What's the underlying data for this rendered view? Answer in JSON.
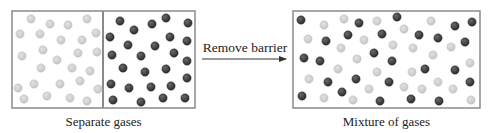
{
  "colors": {
    "box_border": "#8a8a8a",
    "divider": "#8a8a8a",
    "light_particle": "#cfcfcf",
    "light_particle_edge": "#bdbdbd",
    "dark_particle": "#3c3c3c",
    "dark_particle_edge": "#2a2a2a",
    "arrow": "#333333",
    "text": "#222222"
  },
  "particle_radius": 4.2,
  "left_panel": {
    "caption": "Separate gases",
    "box": {
      "x": 12,
      "y": 11,
      "w": 183,
      "h": 97
    },
    "divider_x": 103,
    "light_particles": [
      [
        31,
        19
      ],
      [
        50,
        24
      ],
      [
        68,
        25
      ],
      [
        87,
        19
      ],
      [
        20,
        34
      ],
      [
        40,
        34
      ],
      [
        61,
        40
      ],
      [
        82,
        40
      ],
      [
        96,
        33
      ],
      [
        43,
        50
      ],
      [
        22,
        56
      ],
      [
        57,
        60
      ],
      [
        78,
        53
      ],
      [
        97,
        52
      ],
      [
        41,
        68
      ],
      [
        72,
        68
      ],
      [
        90,
        71
      ],
      [
        18,
        88
      ],
      [
        34,
        84
      ],
      [
        60,
        84
      ],
      [
        80,
        81
      ],
      [
        98,
        89
      ],
      [
        24,
        99
      ],
      [
        47,
        96
      ],
      [
        70,
        98
      ],
      [
        87,
        101
      ]
    ],
    "dark_particles": [
      [
        120,
        21
      ],
      [
        134,
        30
      ],
      [
        152,
        24
      ],
      [
        166,
        18
      ],
      [
        188,
        23
      ],
      [
        110,
        37
      ],
      [
        128,
        45
      ],
      [
        155,
        46
      ],
      [
        170,
        37
      ],
      [
        187,
        41
      ],
      [
        112,
        55
      ],
      [
        141,
        56
      ],
      [
        174,
        53
      ],
      [
        187,
        61
      ],
      [
        123,
        68
      ],
      [
        145,
        72
      ],
      [
        166,
        69
      ],
      [
        187,
        78
      ],
      [
        111,
        84
      ],
      [
        129,
        88
      ],
      [
        151,
        87
      ],
      [
        171,
        86
      ],
      [
        113,
        100
      ],
      [
        141,
        102
      ],
      [
        163,
        98
      ],
      [
        185,
        98
      ]
    ]
  },
  "arrow": {
    "label": "Remove barrier",
    "x1": 202,
    "x2": 286,
    "y": 59
  },
  "right_panel": {
    "caption": "Mixture of gases",
    "box": {
      "x": 293,
      "y": 11,
      "w": 187,
      "h": 97
    },
    "light_particles": [
      [
        324,
        25
      ],
      [
        344,
        19
      ],
      [
        377,
        21
      ],
      [
        431,
        21
      ],
      [
        404,
        29
      ],
      [
        308,
        39
      ],
      [
        364,
        40
      ],
      [
        341,
        48
      ],
      [
        393,
        45
      ],
      [
        413,
        48
      ],
      [
        451,
        47
      ],
      [
        433,
        55
      ],
      [
        357,
        59
      ],
      [
        470,
        63
      ],
      [
        338,
        69
      ],
      [
        377,
        72
      ],
      [
        412,
        72
      ],
      [
        309,
        79
      ],
      [
        438,
        82
      ],
      [
        369,
        89
      ],
      [
        404,
        87
      ],
      [
        422,
        89
      ],
      [
        453,
        89
      ],
      [
        324,
        98
      ],
      [
        353,
        100
      ],
      [
        471,
        100
      ]
    ],
    "dark_particles": [
      [
        301,
        20
      ],
      [
        359,
        23
      ],
      [
        397,
        17
      ],
      [
        455,
        26
      ],
      [
        472,
        22
      ],
      [
        326,
        41
      ],
      [
        348,
        35
      ],
      [
        382,
        34
      ],
      [
        419,
        35
      ],
      [
        438,
        38
      ],
      [
        465,
        42
      ],
      [
        304,
        58
      ],
      [
        320,
        61
      ],
      [
        374,
        53
      ],
      [
        392,
        61
      ],
      [
        425,
        69
      ],
      [
        455,
        70
      ],
      [
        328,
        82
      ],
      [
        356,
        79
      ],
      [
        389,
        82
      ],
      [
        470,
        82
      ],
      [
        302,
        96
      ],
      [
        342,
        92
      ],
      [
        380,
        101
      ],
      [
        411,
        99
      ],
      [
        439,
        101
      ]
    ]
  }
}
